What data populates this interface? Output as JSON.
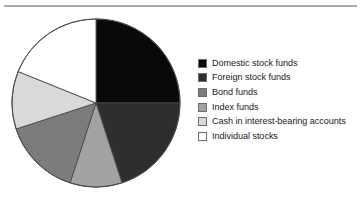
{
  "chart_data": {
    "type": "pie",
    "title": "",
    "subtitle": "",
    "xlabel": "",
    "ylabel": "",
    "grid": false,
    "legend_position": "right",
    "start_angle_deg": 0,
    "direction": "clockwise",
    "center": {
      "cx": 86,
      "cy": 86,
      "r": 84
    },
    "categories": [
      "Domestic stock funds",
      "Foreign stock funds",
      "Bond funds",
      "Index funds",
      "Cash in interest-bearing accounts",
      "Individual stocks"
    ],
    "values": [
      25,
      20,
      15,
      10,
      11,
      19
    ],
    "slices": [
      {
        "label": "Domestic stock funds",
        "value": 25,
        "angle_deg": 90,
        "color": "#090909",
        "order": 1
      },
      {
        "label": "Foreign stock funds",
        "value": 20,
        "angle_deg": 72,
        "color": "#2e2e2e",
        "order": 2
      },
      {
        "label": "Index funds",
        "value": 10,
        "angle_deg": 36,
        "color": "#a2a2a2",
        "order": 3
      },
      {
        "label": "Bond funds",
        "value": 15,
        "angle_deg": 54,
        "color": "#7c7c7c",
        "order": 4
      },
      {
        "label": "Cash in interest-bearing accounts",
        "value": 11,
        "angle_deg": 40,
        "color": "#d9d9d9",
        "order": 5
      },
      {
        "label": "Individual stocks",
        "value": 19,
        "angle_deg": 68,
        "color": "#ffffff",
        "order": 6
      }
    ],
    "slice_outline_color": "#4a4a4a"
  },
  "legend": {
    "items": [
      {
        "label": "Domestic stock funds",
        "color": "#090909"
      },
      {
        "label": "Foreign stock funds",
        "color": "#2e2e2e"
      },
      {
        "label": "Bond funds",
        "color": "#7c7c7c"
      },
      {
        "label": "Index funds",
        "color": "#a2a2a2"
      },
      {
        "label": "Cash in interest-bearing accounts",
        "color": "#d9d9d9"
      },
      {
        "label": "Individual stocks",
        "color": "#ffffff"
      }
    ]
  },
  "decor": {
    "top_rule_color": "#a9a9a9"
  }
}
